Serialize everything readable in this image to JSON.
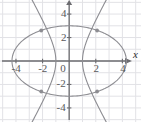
{
  "figure": {
    "background_color": "#ffffff",
    "grid_color": "#e2e2e6",
    "axis_color": "#6b6b6f",
    "curve_color": "#8d8d92",
    "point_color": "#8d8d92",
    "label_color": "#58585a"
  },
  "axes": {
    "x_axis_label": "x",
    "y_axis_label": "",
    "x_ticks": [
      "-4",
      "-2",
      "0",
      "2",
      "4"
    ],
    "y_ticks": [
      "4",
      "2",
      "-2",
      "-4"
    ],
    "origin_label": "0",
    "xlim": [
      -5.2,
      5.4
    ],
    "ylim": [
      -5.2,
      5.2
    ]
  },
  "chart_data": {
    "type": "line",
    "xlabel": "x",
    "ylabel": "",
    "xlim": [
      -5.2,
      5.4
    ],
    "ylim": [
      -5.2,
      5.2
    ],
    "grid": true,
    "legend": "none",
    "x_tick_values": [
      -4,
      -2,
      0,
      2,
      4
    ],
    "y_tick_values": [
      4,
      2,
      -2,
      -4
    ],
    "series": [
      {
        "name": "ellipse",
        "type": "conic-ellipse",
        "equation": "x^2/18 + y^2/9 = 1",
        "semi_axis_x": 4.3,
        "semi_axis_y": 3.0,
        "center": [
          0,
          0
        ]
      },
      {
        "name": "hyperbola",
        "type": "conic-hyperbola",
        "equation": "x^2/1 - y^2/4 = 1",
        "vertex_left": [
          -1.0,
          0
        ],
        "vertex_right": [
          1.0,
          0
        ],
        "semi_axis_a": 1.0,
        "semi_axis_b": 2.0,
        "asymptote_slope": 2.0
      }
    ],
    "intersection_points": [
      {
        "x": -2.1,
        "y": 2.6
      },
      {
        "x": 2.1,
        "y": 2.6
      },
      {
        "x": -2.1,
        "y": -2.6
      },
      {
        "x": 2.1,
        "y": -2.6
      }
    ],
    "annotations": []
  }
}
